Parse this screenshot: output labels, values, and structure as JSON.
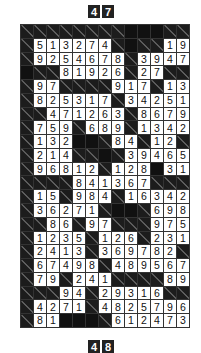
{
  "header_top": {
    "digits": [
      "4",
      "7"
    ]
  },
  "header_bottom": {
    "digits": [
      "4",
      "8"
    ]
  },
  "grid": {
    "cols": 13,
    "rows": [
      [
        "C",
        "C",
        "C",
        "C",
        "C",
        "C",
        "C",
        "C",
        "B",
        "B",
        "B",
        "C",
        "C"
      ],
      [
        "C",
        "5",
        "1",
        "3",
        "2",
        "7",
        "4",
        "C",
        "B",
        "C",
        "C",
        "1",
        "9"
      ],
      [
        "C",
        "9",
        "2",
        "5",
        "4",
        "6",
        "7",
        "8",
        "C",
        "3",
        "9",
        "4",
        "7"
      ],
      [
        "B",
        "C",
        "C",
        "8",
        "1",
        "9",
        "2",
        "6",
        "C",
        "2",
        "7",
        "C",
        "C"
      ],
      [
        "C",
        "9",
        "7",
        "C",
        "C",
        "C",
        "C",
        "9",
        "1",
        "7",
        "C",
        "1",
        "3"
      ],
      [
        "C",
        "8",
        "2",
        "5",
        "3",
        "1",
        "7",
        "C",
        "3",
        "4",
        "2",
        "5",
        "1"
      ],
      [
        "C",
        "C",
        "4",
        "7",
        "1",
        "2",
        "6",
        "3",
        "C",
        "8",
        "6",
        "7",
        "9"
      ],
      [
        "C",
        "7",
        "5",
        "9",
        "C",
        "6",
        "8",
        "9",
        "C",
        "1",
        "3",
        "4",
        "2"
      ],
      [
        "C",
        "1",
        "3",
        "2",
        "B",
        "B",
        "C",
        "8",
        "4",
        "C",
        "1",
        "2",
        "C"
      ],
      [
        "C",
        "2",
        "1",
        "4",
        "C",
        "C",
        "B",
        "C",
        "3",
        "9",
        "4",
        "6",
        "5"
      ],
      [
        "C",
        "9",
        "6",
        "8",
        "1",
        "2",
        "C",
        "1",
        "2",
        "8",
        "B",
        "3",
        "1"
      ],
      [
        "C",
        "C",
        "C",
        "C",
        "8",
        "4",
        "1",
        "3",
        "6",
        "7",
        "C",
        "C",
        "C"
      ],
      [
        "C",
        "1",
        "5",
        "C",
        "9",
        "8",
        "4",
        "C",
        "1",
        "6",
        "3",
        "4",
        "2"
      ],
      [
        "C",
        "3",
        "6",
        "2",
        "7",
        "1",
        "C",
        "B",
        "B",
        "C",
        "6",
        "9",
        "8"
      ],
      [
        "C",
        "C",
        "8",
        "6",
        "C",
        "9",
        "7",
        "C",
        "C",
        "C",
        "9",
        "7",
        "5"
      ],
      [
        "C",
        "1",
        "2",
        "3",
        "5",
        "C",
        "1",
        "2",
        "6",
        "C",
        "2",
        "3",
        "1"
      ],
      [
        "C",
        "2",
        "4",
        "1",
        "3",
        "C",
        "3",
        "6",
        "9",
        "7",
        "8",
        "2",
        "C"
      ],
      [
        "C",
        "6",
        "7",
        "4",
        "9",
        "8",
        "C",
        "4",
        "8",
        "9",
        "5",
        "6",
        "7"
      ],
      [
        "C",
        "7",
        "9",
        "C",
        "2",
        "4",
        "1",
        "C",
        "C",
        "C",
        "C",
        "8",
        "9"
      ],
      [
        "C",
        "C",
        "C",
        "9",
        "4",
        "C",
        "2",
        "9",
        "3",
        "1",
        "6",
        "C",
        "C"
      ],
      [
        "C",
        "4",
        "2",
        "7",
        "1",
        "C",
        "4",
        "8",
        "2",
        "5",
        "7",
        "9",
        "6"
      ],
      [
        "C",
        "8",
        "1",
        "B",
        "B",
        "B",
        "C",
        "6",
        "1",
        "2",
        "4",
        "7",
        "3"
      ]
    ]
  }
}
